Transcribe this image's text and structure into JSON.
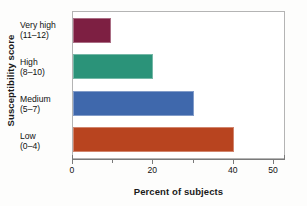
{
  "chart_data": {
    "type": "bar",
    "orientation": "horizontal",
    "title": "",
    "xlabel": "Percent of subjects",
    "ylabel": "Susceptibility score",
    "xlim": [
      0,
      53
    ],
    "ylim": null,
    "grid": false,
    "legend": null,
    "xticks": [
      {
        "value": 0,
        "label": "0",
        "major": true
      },
      {
        "value": 10,
        "label": "",
        "major": false
      },
      {
        "value": 20,
        "label": "20",
        "major": true
      },
      {
        "value": 30,
        "label": "",
        "major": false
      },
      {
        "value": 40,
        "label": "40",
        "major": true
      },
      {
        "value": 50,
        "label": "50",
        "major": true
      }
    ],
    "categories": [
      "Very high (11-12)",
      "High (8-10)",
      "Medium (5-7)",
      "Low (0-4)"
    ],
    "values": [
      9.5,
      20,
      30,
      40
    ],
    "bars": [
      {
        "name_line1": "Very high",
        "name_line2": "(11–12)",
        "value": 9.5,
        "color": "#7D1F42"
      },
      {
        "name_line1": "High",
        "name_line2": "(8–10)",
        "value": 20,
        "color": "#2B9379"
      },
      {
        "name_line1": "Medium",
        "name_line2": "(5–7)",
        "value": 30,
        "color": "#3F68AC"
      },
      {
        "name_line1": "Low",
        "name_line2": "(0–4)",
        "value": 40,
        "color": "#B8441F"
      }
    ]
  },
  "axes": {
    "y_title": "Susceptibility score",
    "x_title": "Percent of subjects"
  }
}
